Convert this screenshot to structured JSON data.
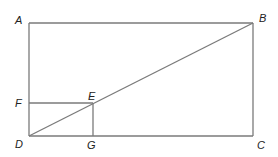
{
  "diagram": {
    "type": "geometry",
    "colors": {
      "line": "#7a7a7a",
      "label": "#222222",
      "background": "#ffffff"
    },
    "points": {
      "A": {
        "label": "A",
        "x": 29,
        "y": 23
      },
      "B": {
        "label": "B",
        "x": 253,
        "y": 23
      },
      "C": {
        "label": "C",
        "x": 253,
        "y": 136
      },
      "D": {
        "label": "D",
        "x": 29,
        "y": 136
      },
      "E": {
        "label": "E",
        "x": 93,
        "y": 103
      },
      "F": {
        "label": "F",
        "x": 29,
        "y": 103
      },
      "G": {
        "label": "G",
        "x": 93,
        "y": 136
      }
    },
    "segments": [
      [
        "A",
        "B"
      ],
      [
        "B",
        "C"
      ],
      [
        "C",
        "D"
      ],
      [
        "D",
        "A"
      ],
      [
        "D",
        "B"
      ],
      [
        "F",
        "E"
      ],
      [
        "E",
        "G"
      ]
    ],
    "labels": {
      "A": "A",
      "B": "B",
      "C": "C",
      "D": "D",
      "E": "E",
      "F": "F",
      "G": "G"
    }
  }
}
